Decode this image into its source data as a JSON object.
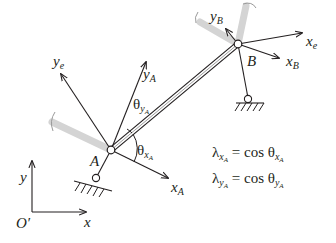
{
  "labels": {
    "global_y": "y",
    "global_x": "x",
    "global_origin": "O′",
    "element_y": "y",
    "element_y_sub": "e",
    "element_x": "x",
    "element_x_sub": "e",
    "node_a": "A",
    "node_b": "B",
    "node_a_x": "x",
    "node_a_x_sub": "A",
    "node_a_y": "y",
    "node_a_y_sub": "A",
    "node_b_x": "x",
    "node_b_x_sub": "B",
    "node_b_y": "y",
    "node_b_y_sub": "B",
    "theta": "θ",
    "theta_x_sub": "x",
    "theta_x_subsub": "A",
    "theta_y_sub": "y",
    "theta_y_subsub": "A"
  },
  "equations": [
    {
      "lambda": "λ",
      "sub": "x",
      "subsub": "A",
      "rhs": " = cos θ",
      "rsub": "x",
      "rsubsub": "A"
    },
    {
      "lambda": "λ",
      "sub": "y",
      "subsub": "A",
      "rhs": " = cos θ",
      "rsub": "y",
      "rsubsub": "A"
    }
  ],
  "colors": {
    "line": "#231f20",
    "ghost": "#d9d9d9"
  }
}
